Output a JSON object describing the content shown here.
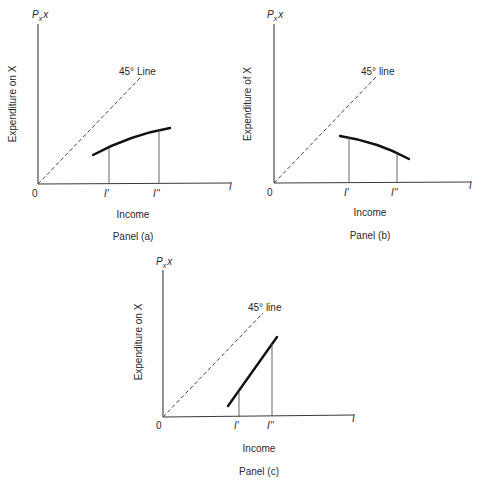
{
  "figure": {
    "panels": [
      {
        "id": "a",
        "caption": "Panel (a)",
        "y_axis_top_label": "P",
        "y_axis_top_sub": "x",
        "y_axis_top_suffix": "x",
        "y_axis_label": "Expenditure on X",
        "x_axis_end_label": "I",
        "x_axis_label": "Income",
        "origin_label": "0",
        "diagonal_label": "45° Line",
        "tick_labels": [
          "I'",
          "I''"
        ],
        "curve_shape": "increasing, concave"
      },
      {
        "id": "b",
        "caption": "Panel (b)",
        "y_axis_top_label": "P",
        "y_axis_top_sub": "x",
        "y_axis_top_suffix": "x",
        "y_axis_label": "Expenditure of X",
        "x_axis_end_label": "I",
        "x_axis_label": "Income",
        "origin_label": "0",
        "diagonal_label": "45° line",
        "tick_labels": [
          "I'",
          "I''"
        ],
        "curve_shape": "decreasing"
      },
      {
        "id": "c",
        "caption": "Panel (c)",
        "y_axis_top_label": "P",
        "y_axis_top_sub": "x",
        "y_axis_top_suffix": "x",
        "y_axis_label": "Expenditure on X",
        "x_axis_end_label": "I",
        "x_axis_label": "Income",
        "origin_label": "0",
        "diagonal_label": "45° line",
        "tick_labels": [
          "I'",
          "I''"
        ],
        "curve_shape": "increasing, steeper than 45°"
      }
    ]
  },
  "colors": {
    "background": "#ffffff",
    "axis": "#3a3a3a",
    "curve": "#111111"
  }
}
